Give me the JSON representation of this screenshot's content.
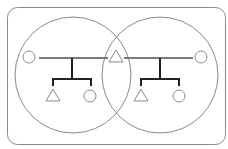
{
  "diagram": {
    "type": "kinship-venn",
    "colors": {
      "background": "#ffffff",
      "frame": "#8a8a8a",
      "venn_circle": "#8a8a8a",
      "symbol": "#8a8a8a",
      "marriage_line": "#7a7a7a",
      "descent_line": "#222222"
    },
    "frame": {
      "x": 7,
      "y": 7,
      "width": 218,
      "height": 137,
      "radius": 10
    },
    "venn_circles": [
      {
        "id": "family-left",
        "cx": 73,
        "cy": 75,
        "r": 58
      },
      {
        "id": "family-right",
        "cx": 160,
        "cy": 75,
        "r": 58
      }
    ],
    "individuals": [
      {
        "id": "wife-left",
        "shape": "circle",
        "sex": "female",
        "cx": 29,
        "cy": 57,
        "size": 6
      },
      {
        "id": "husband-shared",
        "shape": "triangle",
        "sex": "male",
        "cx": 116,
        "cy": 56,
        "size": 7
      },
      {
        "id": "wife-right",
        "shape": "circle",
        "sex": "female",
        "cx": 201,
        "cy": 57,
        "size": 6
      },
      {
        "id": "son-left",
        "shape": "triangle",
        "sex": "male",
        "cx": 53,
        "cy": 95,
        "size": 7
      },
      {
        "id": "daughter-left",
        "shape": "circle",
        "sex": "female",
        "cx": 90,
        "cy": 96,
        "size": 6
      },
      {
        "id": "son-right",
        "shape": "triangle",
        "sex": "male",
        "cx": 141,
        "cy": 95,
        "size": 7
      },
      {
        "id": "daughter-right",
        "shape": "circle",
        "sex": "female",
        "cx": 179,
        "cy": 96,
        "size": 6
      }
    ],
    "marriage_lines": [
      {
        "id": "marriage-left",
        "x1": 39,
        "y1": 58,
        "x2": 108,
        "y2": 58
      },
      {
        "id": "marriage-right",
        "x1": 124,
        "y1": 58,
        "x2": 193,
        "y2": 58
      }
    ],
    "descent_groups": [
      {
        "id": "descent-left",
        "stem_x": 72,
        "stem_top": 58,
        "bar_y": 79,
        "bar_x1": 53,
        "bar_x2": 91,
        "drop_to": 86
      },
      {
        "id": "descent-right",
        "stem_x": 160,
        "stem_top": 58,
        "bar_y": 79,
        "bar_x1": 141,
        "bar_x2": 179,
        "drop_to": 86
      }
    ]
  }
}
